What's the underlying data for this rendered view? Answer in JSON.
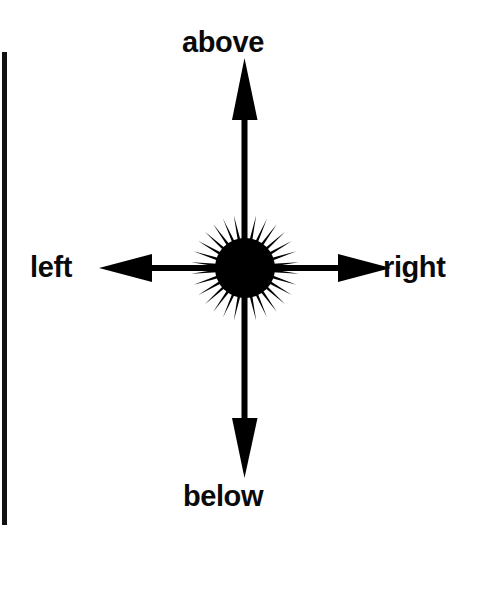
{
  "figure": {
    "background_color": "#ffffff",
    "ink_color": "#000000",
    "width": 492,
    "height": 594
  },
  "labels": {
    "above": "above",
    "below": "below",
    "left": "left",
    "right": "right"
  },
  "icons": {
    "arrow_up": "arrow-up-icon",
    "arrow_down": "arrow-down-icon",
    "arrow_left": "arrow-left-icon",
    "arrow_right": "arrow-right-icon",
    "center": "starburst-icon"
  },
  "chart_data": {
    "type": "diagram",
    "title": "",
    "center": {
      "x": 245,
      "y": 268,
      "shape": "starburst",
      "spikes": 30,
      "core_radius": 30,
      "spike_radius": 54
    },
    "arrows": [
      {
        "name": "above",
        "direction": "up",
        "label": "above",
        "from": [
          245,
          268
        ],
        "to": [
          245,
          62
        ],
        "label_pos": [
          245,
          42
        ]
      },
      {
        "name": "below",
        "direction": "down",
        "label": "below",
        "from": [
          245,
          268
        ],
        "to": [
          245,
          474
        ],
        "label_pos": [
          245,
          497
        ]
      },
      {
        "name": "left",
        "direction": "left",
        "label": "left",
        "from": [
          245,
          268
        ],
        "to": [
          100,
          268
        ],
        "label_pos": [
          58,
          268
        ]
      },
      {
        "name": "right",
        "direction": "right",
        "label": "right",
        "from": [
          245,
          268
        ],
        "to": [
          390,
          268
        ],
        "label_pos": [
          422,
          268
        ]
      }
    ],
    "artifacts": [
      {
        "name": "scan-edge-bar",
        "x": 2,
        "y": 52,
        "width": 5,
        "height": 473,
        "color": "#111111"
      }
    ]
  }
}
